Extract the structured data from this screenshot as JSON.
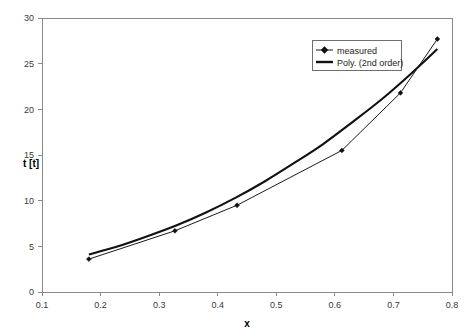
{
  "chart_data": {
    "type": "line",
    "title": "",
    "subtitle": "",
    "xlabel": "x",
    "ylabel": "t [t]",
    "xlim": [
      0.1,
      0.8
    ],
    "ylim": [
      0,
      30
    ],
    "xticks": [
      "0.1",
      "0.2",
      "0.3",
      "0.4",
      "0.5",
      "0.6",
      "0.7",
      "0.8"
    ],
    "xtick_values": [
      0.1,
      0.2,
      0.3,
      0.4,
      0.5,
      0.6,
      0.7,
      0.8
    ],
    "yticks": [
      "0",
      "5",
      "10",
      "15",
      "20",
      "25",
      "30"
    ],
    "ytick_values": [
      0,
      5,
      10,
      15,
      20,
      25,
      30
    ],
    "grid": false,
    "legend_position": "top-right",
    "series": [
      {
        "name": "measured",
        "style": "line-with-diamond-markers",
        "color": "#1a1a1a",
        "x": [
          0.18,
          0.327,
          0.433,
          0.612,
          0.712,
          0.775
        ],
        "values": [
          3.6,
          6.7,
          9.5,
          15.5,
          21.8,
          27.7
        ]
      },
      {
        "name": "Poly. (2nd order)",
        "style": "thick-smooth-line",
        "color": "#111111",
        "fit": "quadratic",
        "x": [
          0.18,
          0.23,
          0.28,
          0.33,
          0.38,
          0.43,
          0.48,
          0.53,
          0.58,
          0.63,
          0.68,
          0.73,
          0.775
        ],
        "values": [
          4.1,
          5.0,
          6.1,
          7.3,
          8.7,
          10.3,
          12.1,
          14.1,
          16.2,
          18.6,
          21.1,
          23.9,
          26.6
        ]
      }
    ]
  },
  "legend": {
    "entries": [
      {
        "label": "measured"
      },
      {
        "label": "Poly. (2nd order)"
      }
    ]
  },
  "axes": {
    "x_title": "x",
    "y_title": "t [t]"
  }
}
